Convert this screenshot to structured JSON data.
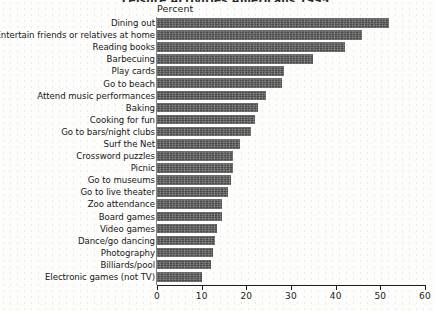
{
  "chart_data": {
    "type": "bar",
    "orientation": "horizontal",
    "title": "Leisure Activities Americans 1995",
    "title_visible": false,
    "xlabel": "Percent",
    "ylabel": "",
    "xlim": [
      0,
      60
    ],
    "xticks": [
      0,
      10,
      20,
      30,
      40,
      50,
      60
    ],
    "grid": false,
    "legend": null,
    "bar_color": "#4f4f4f",
    "categories": [
      "Dining out",
      "Entertain friends or relatives at home",
      "Reading books",
      "Barbecuing",
      "Play cards",
      "Go to beach",
      "Attend music performances",
      "Baking",
      "Cooking for fun",
      "Go to bars/night clubs",
      "Surf the Net",
      "Crossword puzzles",
      "Picnic",
      "Go to museums",
      "Go to live theater",
      "Zoo attendance",
      "Board games",
      "Video games",
      "Dance/go dancing",
      "Photography",
      "Billiards/pool",
      "Electronic games (not TV)"
    ],
    "values": [
      52,
      46,
      42,
      35,
      28.5,
      28,
      24.5,
      22.5,
      22,
      21,
      18.5,
      17,
      17,
      16.5,
      16,
      14.5,
      14.5,
      13.5,
      13,
      12.5,
      12,
      10
    ]
  },
  "axis": {
    "percent_label": "Percent",
    "tick_labels": [
      "0",
      "10",
      "20",
      "30",
      "40",
      "50",
      "60"
    ]
  }
}
